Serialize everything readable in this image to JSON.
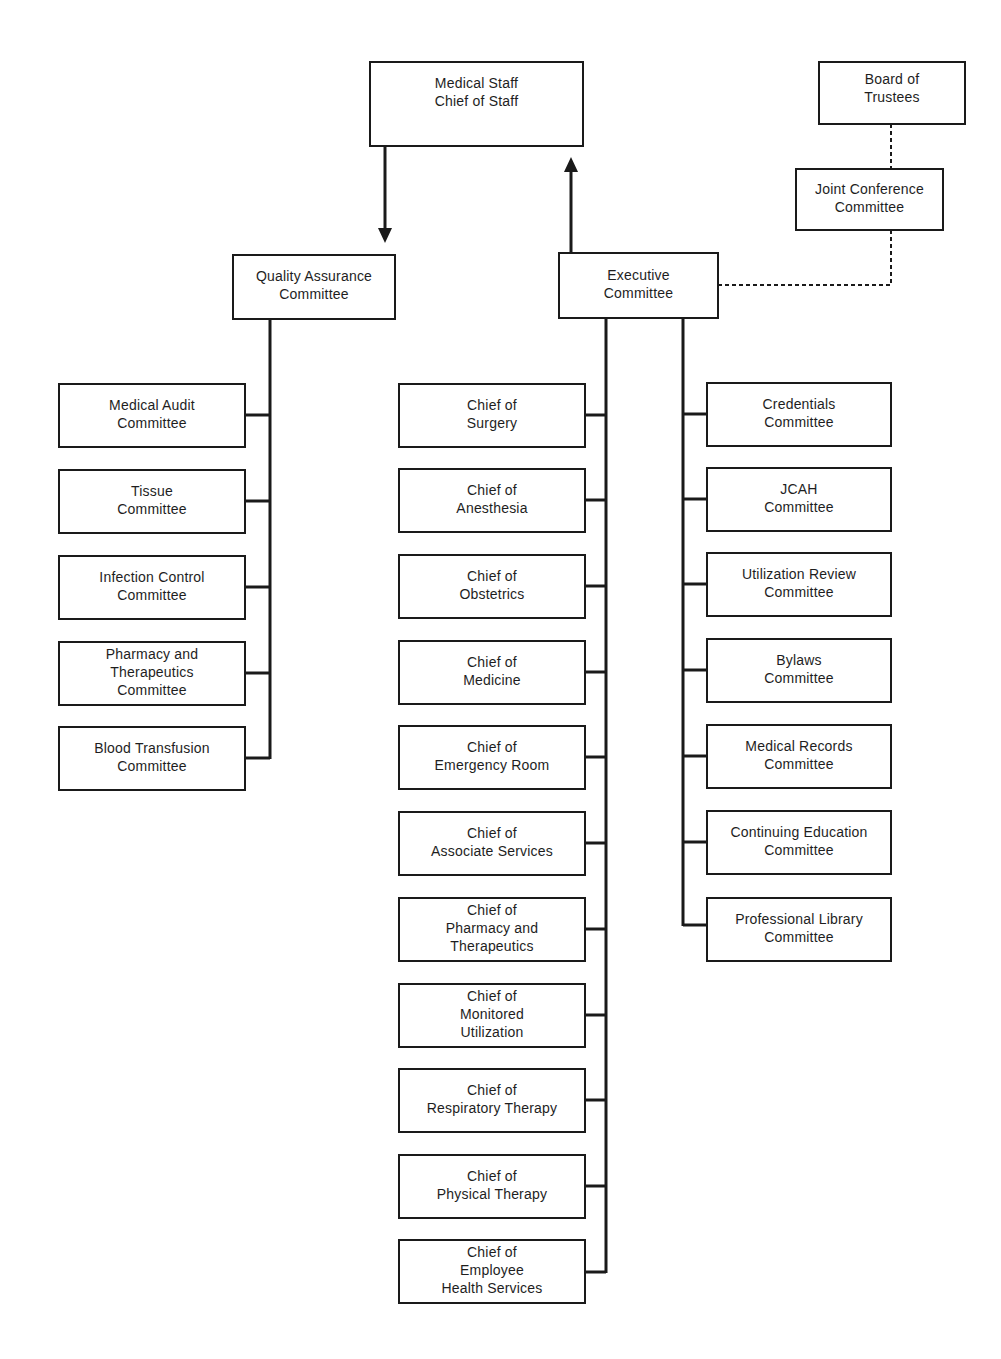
{
  "top": {
    "medical_staff": "Medical Staff\nChief of Staff",
    "board_of_trustees": "Board of\nTrustees",
    "joint_conference": "Joint Conference\nCommittee",
    "quality_assurance": "Quality Assurance\nCommittee",
    "executive": "Executive\nCommittee"
  },
  "quality_assurance_committees": [
    "Medical Audit\nCommittee",
    "Tissue\nCommittee",
    "Infection Control\nCommittee",
    "Pharmacy and\nTherapeutics\nCommittee",
    "Blood Transfusion\nCommittee"
  ],
  "chiefs": [
    "Chief of\nSurgery",
    "Chief of\nAnesthesia",
    "Chief of\nObstetrics",
    "Chief of\nMedicine",
    "Chief of\nEmergency Room",
    "Chief of\nAssociate Services",
    "Chief of\nPharmacy and\nTherapeutics",
    "Chief of\nMonitored\nUtilization",
    "Chief of\nRespiratory Therapy",
    "Chief of\nPhysical Therapy",
    "Chief of\nEmployee\nHealth Services"
  ],
  "executive_committees": [
    "Credentials\nCommittee",
    "JCAH\nCommittee",
    "Utilization Review\nCommittee",
    "Bylaws\nCommittee",
    "Medical Records\nCommittee",
    "Continuing Education\nCommittee",
    "Professional Library\nCommittee"
  ],
  "colors": {
    "line": "#1a1a1a",
    "text": "#1e1e1e",
    "background": "#ffffff"
  }
}
